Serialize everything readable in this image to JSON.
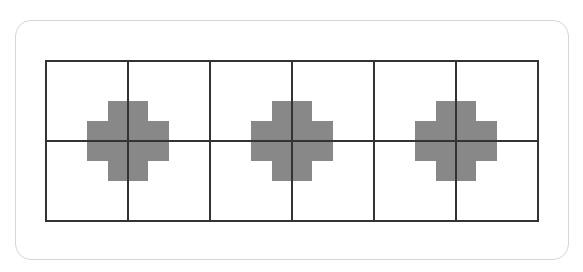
{
  "diagram": {
    "grid": {
      "columns": 6,
      "rows": 2,
      "cell_width": 82,
      "cell_height": 80,
      "line_color": "#333333"
    },
    "shapes": [
      {
        "type": "plus",
        "center_col_line": 1,
        "color": "#888888"
      },
      {
        "type": "plus",
        "center_col_line": 3,
        "color": "#888888"
      },
      {
        "type": "plus",
        "center_col_line": 5,
        "color": "#888888"
      }
    ],
    "card_border_color": "#d6d6d6"
  }
}
